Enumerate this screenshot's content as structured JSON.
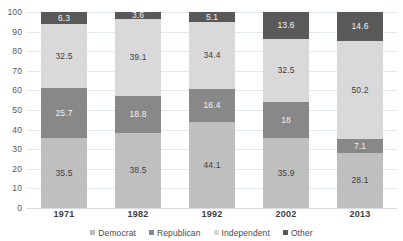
{
  "chart_data": {
    "type": "bar",
    "subtype": "stacked-column-100",
    "title": "",
    "xlabel": "",
    "ylabel": "",
    "ylim": [
      0,
      100
    ],
    "yticks": [
      0,
      10,
      20,
      30,
      40,
      50,
      60,
      70,
      80,
      90,
      100
    ],
    "grid": true,
    "legend_position": "bottom",
    "stack_order": "bottom-to-top",
    "categories": [
      "1971",
      "1982",
      "1992",
      "2002",
      "2013"
    ],
    "series": [
      {
        "name": "Democrat",
        "color": "#bfbfbf",
        "values": [
          35.5,
          38.5,
          44.1,
          35.9,
          28.1
        ],
        "labels": [
          "35.5",
          "38.5",
          "44.1",
          "35.9",
          "28.1"
        ]
      },
      {
        "name": "Republican",
        "color": "#888888",
        "values": [
          25.7,
          18.8,
          16.4,
          18.0,
          7.1
        ],
        "labels": [
          "25.7",
          "18.8",
          "16.4",
          "18",
          "7.1"
        ]
      },
      {
        "name": "Independent",
        "color": "#d9d9d9",
        "values": [
          32.5,
          39.1,
          34.4,
          32.5,
          50.2
        ],
        "labels": [
          "32.5",
          "39.1",
          "34.4",
          "32.5",
          "50.2"
        ]
      },
      {
        "name": "Other",
        "color": "#595959",
        "values": [
          6.3,
          3.6,
          5.1,
          13.6,
          14.6
        ],
        "labels": [
          "6.3",
          "3.6",
          "5.1",
          "13.6",
          "14.6"
        ]
      }
    ]
  },
  "colors": {
    "democrat": "#bfbfbf",
    "republican": "#888888",
    "independent": "#d9d9d9",
    "other": "#595959",
    "gridline": "#e4e9ef",
    "axis_text": "#585858",
    "label_text": "#3f3f3f",
    "background": "#ffffff"
  },
  "legend": {
    "items": [
      {
        "label": "Democrat"
      },
      {
        "label": "Republican"
      },
      {
        "label": "Independent"
      },
      {
        "label": "Other"
      }
    ]
  }
}
